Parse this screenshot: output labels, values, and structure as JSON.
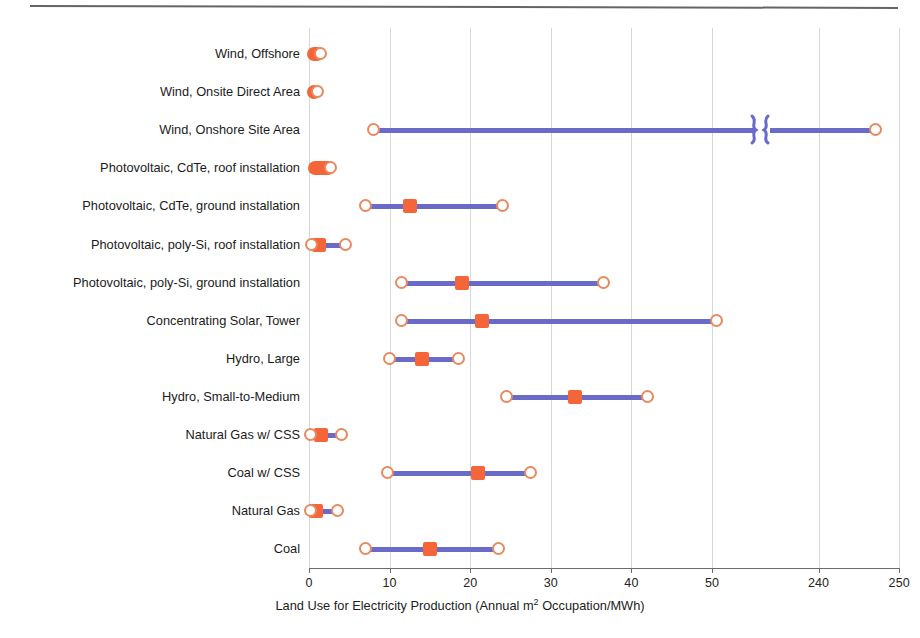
{
  "figure": {
    "has_top_rule": true,
    "colors": {
      "range_line": "#6a6ac8",
      "mean_marker": "#f4653a",
      "endpoint_stroke": "#e8895f",
      "gridline": "#d8d8dc",
      "axis": "#6d6d6d",
      "text": "#1b1b1b",
      "background": "#ffffff"
    }
  },
  "axis": {
    "title": "Land Use for Electricity Production (Annual m",
    "title_sup": "2",
    "title_tail": " Occupation/MWh)",
    "ticks": [
      {
        "label": "0",
        "value": 0
      },
      {
        "label": "10",
        "value": 10
      },
      {
        "label": "20",
        "value": 20
      },
      {
        "label": "30",
        "value": 30
      },
      {
        "label": "40",
        "value": 40
      },
      {
        "label": "50",
        "value": 50
      },
      {
        "label": "240",
        "value": 240
      },
      {
        "label": "250",
        "value": 250
      }
    ],
    "broken": true,
    "break_between": [
      50,
      240
    ]
  },
  "chart_data": {
    "type": "bar",
    "title": "",
    "subtitle": "",
    "xlabel": "Land Use for Electricity Production (Annual m2 Occupation/MWh)",
    "ylabel": "",
    "xlim": [
      0,
      250
    ],
    "axis_break": [
      55,
      235
    ],
    "grid": true,
    "legend": [],
    "tick_labels": [
      "0",
      "10",
      "20",
      "30",
      "40",
      "50",
      "240",
      "250"
    ],
    "categories": [
      "Wind, Offshore",
      "Wind, Onsite Direct Area",
      "Wind, Onshore Site Area",
      "Photovoltaic, CdTe, roof installation",
      "Photovoltaic, CdTe, ground installation",
      "Photovoltaic, poly-Si, roof installation",
      "Photovoltaic, poly-Si, ground installation",
      "Concentrating Solar, Tower",
      "Hydro, Large",
      "Hydro, Small-to-Medium",
      "Natural Gas w/ CSS",
      "Coal w/ CSS",
      "Natural Gas",
      "Coal"
    ],
    "series": [
      {
        "name": "low",
        "values": [
          0.1,
          0.1,
          8.0,
          0.2,
          7.0,
          0.3,
          11.5,
          11.5,
          10.0,
          24.5,
          0.2,
          9.8,
          0.2,
          7.0
        ]
      },
      {
        "name": "mean",
        "values": [
          0.4,
          0.4,
          0.0,
          0.6,
          12.5,
          1.2,
          19.0,
          21.5,
          14.0,
          33.0,
          1.5,
          21.0,
          0.9,
          15.0
        ]
      },
      {
        "name": "high",
        "values": [
          1.3,
          0.9,
          247.0,
          2.6,
          24.0,
          4.5,
          36.5,
          50.5,
          18.5,
          42.0,
          4.0,
          27.5,
          3.5,
          23.5
        ]
      }
    ],
    "rows": [
      {
        "category": "Wind, Offshore",
        "low": 0.1,
        "mean": 0.4,
        "high": 1.3,
        "style": "pill"
      },
      {
        "category": "Wind, Onsite Direct Area",
        "low": 0.1,
        "mean": 0.4,
        "high": 0.9,
        "style": "pill"
      },
      {
        "category": "Wind, Onshore Site Area",
        "low": 8.0,
        "mean": null,
        "high": 247.0,
        "style": "range"
      },
      {
        "category": "Photovoltaic, CdTe, roof installation",
        "low": 0.2,
        "mean": 0.6,
        "high": 2.6,
        "style": "pill"
      },
      {
        "category": "Photovoltaic, CdTe, ground installation",
        "low": 7.0,
        "mean": 12.5,
        "high": 24.0,
        "style": "range"
      },
      {
        "category": "Photovoltaic, poly-Si, roof installation",
        "low": 0.3,
        "mean": 1.2,
        "high": 4.5,
        "style": "range"
      },
      {
        "category": "Photovoltaic, poly-Si, ground installation",
        "low": 11.5,
        "mean": 19.0,
        "high": 36.5,
        "style": "range"
      },
      {
        "category": "Concentrating Solar, Tower",
        "low": 11.5,
        "mean": 21.5,
        "high": 50.5,
        "style": "range"
      },
      {
        "category": "Hydro, Large",
        "low": 10.0,
        "mean": 14.0,
        "high": 18.5,
        "style": "range"
      },
      {
        "category": "Hydro, Small-to-Medium",
        "low": 24.5,
        "mean": 33.0,
        "high": 42.0,
        "style": "range"
      },
      {
        "category": "Natural Gas w/ CSS",
        "low": 0.2,
        "mean": 1.5,
        "high": 4.0,
        "style": "range"
      },
      {
        "category": "Coal w/ CSS",
        "low": 9.8,
        "mean": 21.0,
        "high": 27.5,
        "style": "range"
      },
      {
        "category": "Natural Gas",
        "low": 0.2,
        "mean": 0.9,
        "high": 3.5,
        "style": "range"
      },
      {
        "category": "Coal",
        "low": 7.0,
        "mean": 15.0,
        "high": 23.5,
        "style": "range"
      }
    ]
  }
}
